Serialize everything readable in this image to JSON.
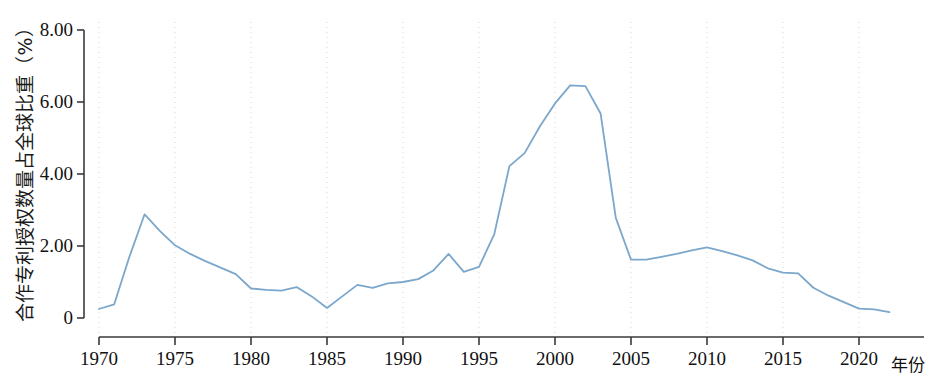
{
  "chart_data": {
    "type": "line",
    "title": "",
    "xlabel": "年份",
    "ylabel": "合作专利授权数量占全球比重（%）",
    "xlim": [
      1970,
      2022
    ],
    "ylim": [
      0,
      8
    ],
    "grid": "vertical-dotted-every-5-years",
    "legend": "none",
    "line_color": "#7ba7cc",
    "y_ticks": [
      "0",
      "2.00",
      "4.00",
      "6.00",
      "8.00"
    ],
    "y_tick_values": [
      0,
      2,
      4,
      6,
      8
    ],
    "x_ticks": [
      "1970",
      "1975",
      "1980",
      "1985",
      "1990",
      "1995",
      "2000",
      "2005",
      "2010",
      "2015",
      "2020"
    ],
    "x_tick_values": [
      1970,
      1975,
      1980,
      1985,
      1990,
      1995,
      2000,
      2005,
      2010,
      2015,
      2020
    ],
    "x": [
      1970,
      1971,
      1972,
      1973,
      1974,
      1975,
      1976,
      1977,
      1978,
      1979,
      1980,
      1981,
      1982,
      1983,
      1984,
      1985,
      1986,
      1987,
      1988,
      1989,
      1990,
      1991,
      1992,
      1993,
      1994,
      1995,
      1996,
      1997,
      1998,
      1999,
      2000,
      2001,
      2002,
      2003,
      2004,
      2005,
      2006,
      2007,
      2008,
      2009,
      2010,
      2011,
      2012,
      2013,
      2014,
      2015,
      2016,
      2017,
      2018,
      2019,
      2020,
      2021,
      2022
    ],
    "values": [
      0.25,
      0.38,
      1.7,
      2.88,
      2.42,
      2.02,
      1.78,
      1.58,
      1.4,
      1.22,
      0.82,
      0.78,
      0.76,
      0.86,
      0.6,
      0.28,
      0.6,
      0.92,
      0.84,
      0.96,
      1.0,
      1.08,
      1.32,
      1.78,
      1.28,
      1.42,
      2.32,
      4.22,
      4.58,
      5.32,
      5.96,
      6.46,
      6.44,
      5.68,
      2.78,
      1.62,
      1.62,
      1.7,
      1.78,
      1.88,
      1.96,
      1.86,
      1.74,
      1.6,
      1.38,
      1.26,
      1.24,
      0.84,
      0.62,
      0.44,
      0.26,
      0.24,
      0.16
    ]
  },
  "axes": {
    "y_axis_name": "y-axis",
    "x_axis_name": "x-axis"
  }
}
